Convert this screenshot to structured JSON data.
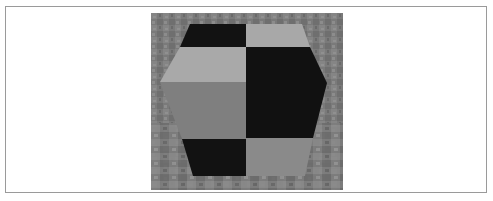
{
  "figure": {
    "colors": {
      "frame_border": "#9a9a9a",
      "background": "#ffffff",
      "ground_base": "#7a7a7a",
      "ground_light": "#8e8e8e",
      "ground_dark": "#666666",
      "tile_dark": "#121212",
      "tile_light": "#a8a8a8",
      "tile_mid": "#7f7f7f",
      "tile_mid_light": "#8a8a8a"
    }
  }
}
